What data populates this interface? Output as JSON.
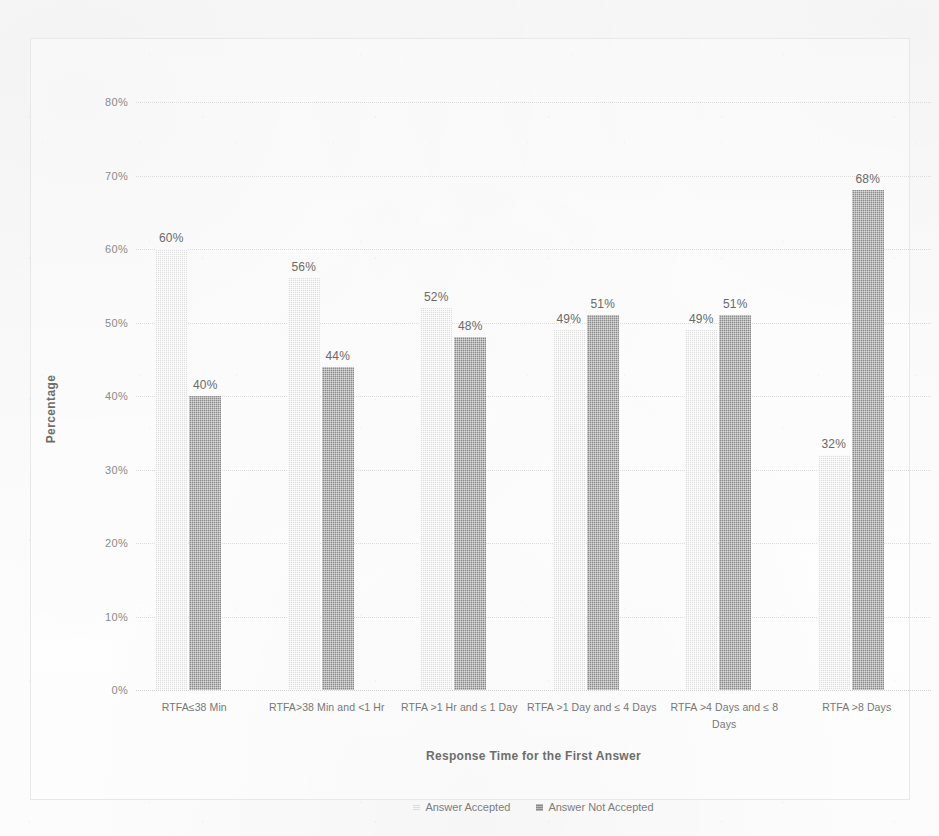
{
  "chart_data": {
    "type": "bar",
    "title": "",
    "xlabel": "Response Time for the First Answer",
    "ylabel": "Percentage",
    "ylim": [
      0,
      80
    ],
    "ytick_labels": [
      "80%",
      "70%",
      "60%",
      "50%",
      "40%",
      "30%",
      "20%",
      "10%",
      "0%"
    ],
    "ytick_values": [
      80,
      70,
      60,
      50,
      40,
      30,
      20,
      10,
      0
    ],
    "grid": true,
    "legend_position": "bottom",
    "categories": [
      "RTFA≤38 Min",
      "RTFA>38 Min and <1 Hr",
      "RTFA >1 Hr and ≤ 1 Day",
      "RTFA >1 Day and ≤ 4 Days",
      "RTFA >4 Days and ≤ 8 Days",
      "RTFA >8 Days"
    ],
    "series": [
      {
        "name": "Answer Accepted",
        "color": "#dedede",
        "values": [
          60,
          56,
          52,
          49,
          49,
          32
        ],
        "labels": [
          "60%",
          "56%",
          "52%",
          "49%",
          "49%",
          "32%"
        ]
      },
      {
        "name": "Answer Not Accepted",
        "color": "#8a8a8a",
        "values": [
          40,
          44,
          48,
          51,
          51,
          68
        ],
        "labels": [
          "40%",
          "44%",
          "48%",
          "51%",
          "51%",
          "68%"
        ]
      }
    ]
  }
}
